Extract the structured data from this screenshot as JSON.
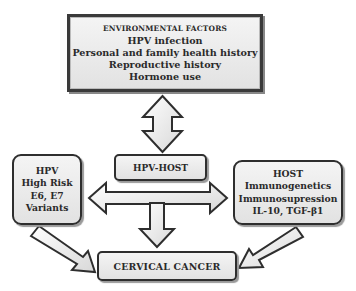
{
  "diagram": {
    "environmental_factors": {
      "heading": "ENVIRONMENTAL FACTORS",
      "items": [
        "HPV infection",
        "Personal and family health history",
        "Reproductive history",
        "Hormone use"
      ]
    },
    "hpv_host": {
      "label": "HPV-HOST"
    },
    "hpv": {
      "lines": [
        "HPV",
        "High Risk",
        "E6, E7",
        "Variants"
      ]
    },
    "host": {
      "lines": [
        "HOST",
        "Immunogenetics",
        "Immunosupression",
        "IL-10, TGF-β1"
      ]
    },
    "outcome": {
      "label": "CERVICAL CANCER"
    },
    "arrows": [
      {
        "from": "environmental_factors",
        "to": "hpv_host",
        "type": "bidirectional-vertical"
      },
      {
        "from": "hpv",
        "to": "host",
        "type": "bidirectional-horizontal"
      },
      {
        "from": "hpv_host",
        "to": "outcome",
        "type": "down"
      },
      {
        "from": "hpv",
        "to": "outcome",
        "type": "diagonal"
      },
      {
        "from": "host",
        "to": "outcome",
        "type": "diagonal"
      }
    ],
    "colors": {
      "outline": "#2e2e2e",
      "fill_light": "#f4f4f4",
      "fill_dark": "#e2e2e2",
      "background": "#ffffff"
    }
  }
}
